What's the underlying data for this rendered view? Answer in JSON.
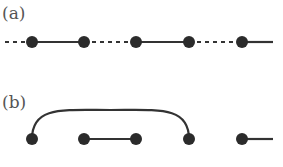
{
  "panels": [
    {
      "label": "(a)",
      "label_pos": [
        2,
        3
      ],
      "y": 42,
      "nodes": [
        32,
        84,
        136,
        189,
        242
      ],
      "segments": [
        {
          "x1": 5,
          "x2": 32,
          "style": "dashed"
        },
        {
          "x1": 32,
          "x2": 84,
          "style": "solid"
        },
        {
          "x1": 84,
          "x2": 136,
          "style": "dashed"
        },
        {
          "x1": 136,
          "x2": 189,
          "style": "solid"
        },
        {
          "x1": 189,
          "x2": 242,
          "style": "dashed"
        },
        {
          "x1": 242,
          "x2": 273,
          "style": "solid"
        }
      ],
      "arcs": []
    },
    {
      "label": "(b)",
      "label_pos": [
        2,
        92
      ],
      "y": 139,
      "nodes": [
        32,
        84,
        136,
        189,
        242
      ],
      "segments": [
        {
          "x1": 84,
          "x2": 136,
          "style": "solid"
        },
        {
          "x1": 242,
          "x2": 273,
          "style": "solid"
        }
      ],
      "arcs": [
        {
          "x1": 32,
          "x2": 189,
          "peak_y": 110
        }
      ]
    }
  ],
  "colors": {
    "node": "#2b2b2b",
    "line": "#333333",
    "label": "#555555"
  },
  "node_radius": 6,
  "line_width": 2.2
}
